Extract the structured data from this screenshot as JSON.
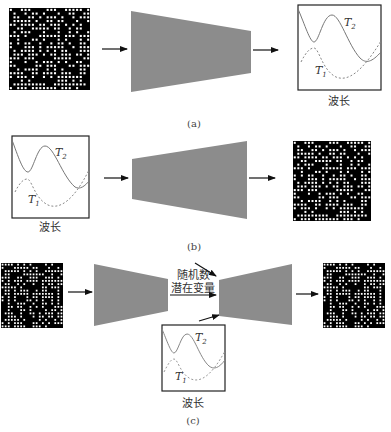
{
  "figure": {
    "panels": [
      {
        "id": "a",
        "caption": "(a)",
        "flow": [
          "structure-grid",
          "forward-network",
          "spectrum-chart"
        ],
        "chart": {
          "xlabel": "波长",
          "curves": [
            {
              "name": "T",
              "sub": "2",
              "style": "solid"
            },
            {
              "name": "T",
              "sub": "1",
              "style": "dashed"
            }
          ]
        }
      },
      {
        "id": "b",
        "caption": "(b)",
        "flow": [
          "spectrum-chart",
          "inverse-network",
          "structure-grid"
        ],
        "chart": {
          "xlabel": "波长",
          "curves": [
            {
              "name": "T",
              "sub": "2",
              "style": "solid"
            },
            {
              "name": "T",
              "sub": "1",
              "style": "dashed"
            }
          ]
        }
      },
      {
        "id": "c",
        "caption": "(c)",
        "flow": [
          "structure-grid",
          "encoder",
          "decoder",
          "structure-grid"
        ],
        "latent_labels": [
          "随机数",
          "潜在变量"
        ],
        "chart": {
          "xlabel": "波长",
          "curves": [
            {
              "name": "T",
              "sub": "2",
              "style": "solid"
            },
            {
              "name": "T",
              "sub": "1",
              "style": "dashed"
            }
          ]
        }
      }
    ],
    "colors": {
      "network_fill": "#8c8c8c",
      "grid_bg": "#000000",
      "grid_dot": "#ffffff",
      "curve": "#777777",
      "arrow": "#111111"
    }
  }
}
